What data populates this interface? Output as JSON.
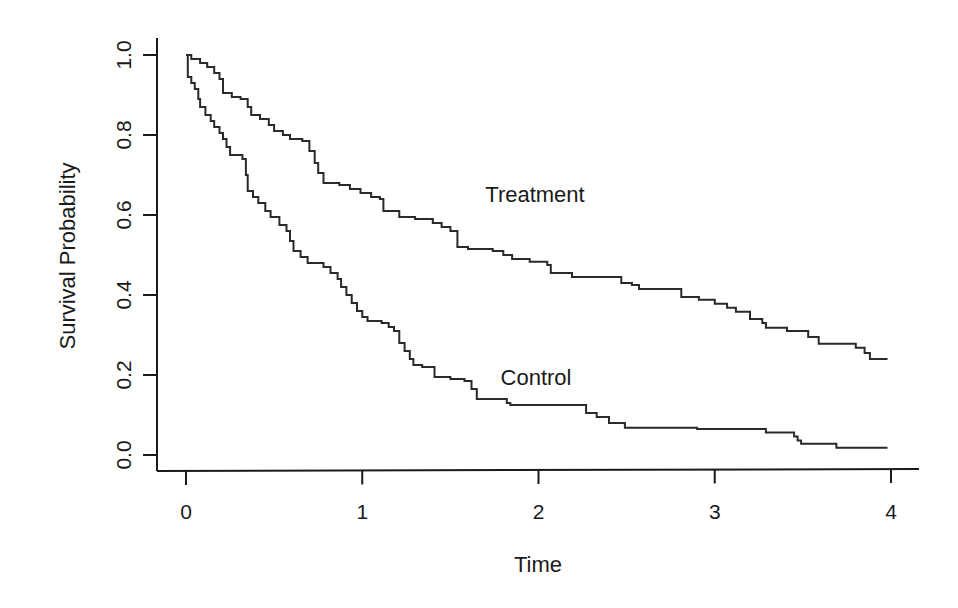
{
  "chart_data": {
    "type": "line",
    "subtype": "step (Kaplan-Meier survival curves)",
    "title": "",
    "xlabel": "Time",
    "ylabel": "Survival Probability",
    "xlim": [
      0,
      4
    ],
    "ylim": [
      0,
      1
    ],
    "x_ticks": [
      0,
      1,
      2,
      3,
      4
    ],
    "x_tick_labels": [
      "0",
      "1",
      "2",
      "3",
      "4"
    ],
    "y_ticks": [
      0.0,
      0.2,
      0.4,
      0.6,
      0.8,
      1.0
    ],
    "y_tick_labels": [
      "0.0",
      "0.2",
      "0.4",
      "0.6",
      "0.8",
      "1.0"
    ],
    "grid": false,
    "legend": "none (curves labeled directly)",
    "annotations": [
      {
        "text": "Treatment",
        "x": 1.98,
        "y": 0.65
      },
      {
        "text": "Control",
        "x": 1.98,
        "y": 0.2
      }
    ],
    "series": [
      {
        "name": "Treatment",
        "color": "#2a2a2a",
        "points": [
          [
            0.0,
            1.0
          ],
          [
            0.03,
            0.99
          ],
          [
            0.08,
            0.98
          ],
          [
            0.12,
            0.97
          ],
          [
            0.16,
            0.955
          ],
          [
            0.19,
            0.94
          ],
          [
            0.21,
            0.905
          ],
          [
            0.26,
            0.895
          ],
          [
            0.31,
            0.89
          ],
          [
            0.35,
            0.87
          ],
          [
            0.37,
            0.85
          ],
          [
            0.42,
            0.84
          ],
          [
            0.47,
            0.825
          ],
          [
            0.5,
            0.81
          ],
          [
            0.55,
            0.8
          ],
          [
            0.59,
            0.79
          ],
          [
            0.66,
            0.785
          ],
          [
            0.7,
            0.76
          ],
          [
            0.73,
            0.73
          ],
          [
            0.75,
            0.705
          ],
          [
            0.78,
            0.68
          ],
          [
            0.87,
            0.675
          ],
          [
            0.93,
            0.665
          ],
          [
            0.99,
            0.655
          ],
          [
            1.05,
            0.645
          ],
          [
            1.1,
            0.64
          ],
          [
            1.12,
            0.61
          ],
          [
            1.21,
            0.595
          ],
          [
            1.3,
            0.59
          ],
          [
            1.4,
            0.58
          ],
          [
            1.45,
            0.57
          ],
          [
            1.5,
            0.56
          ],
          [
            1.54,
            0.52
          ],
          [
            1.6,
            0.515
          ],
          [
            1.74,
            0.51
          ],
          [
            1.8,
            0.5
          ],
          [
            1.85,
            0.49
          ],
          [
            1.95,
            0.483
          ],
          [
            2.05,
            0.475
          ],
          [
            2.07,
            0.455
          ],
          [
            2.19,
            0.445
          ],
          [
            2.47,
            0.43
          ],
          [
            2.53,
            0.425
          ],
          [
            2.57,
            0.415
          ],
          [
            2.81,
            0.395
          ],
          [
            2.91,
            0.388
          ],
          [
            3.0,
            0.378
          ],
          [
            3.07,
            0.368
          ],
          [
            3.12,
            0.358
          ],
          [
            3.2,
            0.34
          ],
          [
            3.27,
            0.33
          ],
          [
            3.29,
            0.318
          ],
          [
            3.41,
            0.31
          ],
          [
            3.53,
            0.295
          ],
          [
            3.59,
            0.278
          ],
          [
            3.8,
            0.268
          ],
          [
            3.85,
            0.255
          ],
          [
            3.88,
            0.24
          ],
          [
            3.98,
            0.24
          ]
        ]
      },
      {
        "name": "Control",
        "color": "#2a2a2a",
        "points": [
          [
            0.0,
            1.0
          ],
          [
            0.01,
            0.945
          ],
          [
            0.03,
            0.93
          ],
          [
            0.05,
            0.915
          ],
          [
            0.07,
            0.89
          ],
          [
            0.08,
            0.87
          ],
          [
            0.11,
            0.85
          ],
          [
            0.14,
            0.835
          ],
          [
            0.16,
            0.82
          ],
          [
            0.19,
            0.805
          ],
          [
            0.21,
            0.79
          ],
          [
            0.23,
            0.77
          ],
          [
            0.25,
            0.75
          ],
          [
            0.32,
            0.74
          ],
          [
            0.34,
            0.7
          ],
          [
            0.35,
            0.66
          ],
          [
            0.38,
            0.645
          ],
          [
            0.41,
            0.63
          ],
          [
            0.45,
            0.61
          ],
          [
            0.48,
            0.595
          ],
          [
            0.53,
            0.575
          ],
          [
            0.57,
            0.56
          ],
          [
            0.59,
            0.535
          ],
          [
            0.61,
            0.51
          ],
          [
            0.65,
            0.495
          ],
          [
            0.69,
            0.48
          ],
          [
            0.78,
            0.47
          ],
          [
            0.82,
            0.455
          ],
          [
            0.86,
            0.44
          ],
          [
            0.88,
            0.42
          ],
          [
            0.91,
            0.4
          ],
          [
            0.94,
            0.38
          ],
          [
            0.97,
            0.36
          ],
          [
            1.0,
            0.345
          ],
          [
            1.03,
            0.335
          ],
          [
            1.11,
            0.33
          ],
          [
            1.15,
            0.32
          ],
          [
            1.18,
            0.31
          ],
          [
            1.21,
            0.28
          ],
          [
            1.24,
            0.26
          ],
          [
            1.27,
            0.24
          ],
          [
            1.29,
            0.225
          ],
          [
            1.34,
            0.22
          ],
          [
            1.41,
            0.195
          ],
          [
            1.5,
            0.19
          ],
          [
            1.58,
            0.185
          ],
          [
            1.62,
            0.165
          ],
          [
            1.65,
            0.14
          ],
          [
            1.82,
            0.13
          ],
          [
            1.84,
            0.125
          ],
          [
            2.21,
            0.125
          ],
          [
            2.27,
            0.105
          ],
          [
            2.33,
            0.095
          ],
          [
            2.4,
            0.08
          ],
          [
            2.49,
            0.068
          ],
          [
            2.9,
            0.065
          ],
          [
            3.29,
            0.056
          ],
          [
            3.45,
            0.046
          ],
          [
            3.47,
            0.036
          ],
          [
            3.49,
            0.028
          ],
          [
            3.69,
            0.018
          ],
          [
            3.98,
            0.018
          ]
        ]
      }
    ]
  },
  "labels": {
    "xlabel": "Time",
    "ylabel": "Survival Probability",
    "treatment": "Treatment",
    "control": "Control"
  }
}
